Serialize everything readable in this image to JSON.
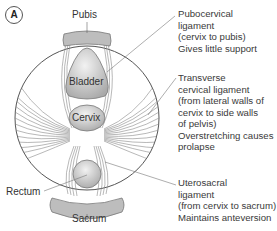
{
  "panel_label": "A",
  "organs": {
    "pubis": "Pubis",
    "bladder": "Bladder",
    "cervix": "Cervix",
    "rectum": "Rectum",
    "sacrum": "Sacrum"
  },
  "annotations": [
    {
      "lines": [
        "Pubocervical",
        "ligament",
        "(cervix to pubis)",
        "Gives little support"
      ]
    },
    {
      "lines": [
        "Transverse",
        "cervical ligament",
        "(from lateral walls of",
        "cervix to side walls",
        "of pelvis)",
        "Overstretching causes",
        "prolapse"
      ]
    },
    {
      "lines": [
        "Uterosacral",
        "ligament",
        "(from cervix to sacrum)",
        "Maintains anteversion"
      ]
    }
  ],
  "colors": {
    "organ_fill": "#c8c8c8",
    "bone_fill": "#b9b9b9",
    "outline": "#777777",
    "ligament": "#8a8a8a"
  }
}
